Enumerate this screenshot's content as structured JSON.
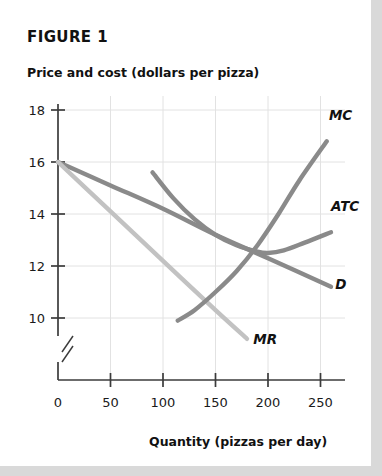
{
  "figure": {
    "title": "FIGURE 1",
    "y_axis_title": "Price and cost (dollars per pizza)",
    "x_axis_title": "Quantity (pizzas per day)"
  },
  "colors": {
    "page_background": "#ffffff",
    "surround": "#d9d9d9",
    "axis": "#3b3b3b",
    "gridline": "#e2e2e2",
    "demand_curve": "#8a8a8a",
    "marginal_revenue_curve": "#c2c2c2",
    "marginal_cost_curve": "#8a8a8a",
    "average_total_cost_curve": "#8a8a8a",
    "text": "#111111"
  },
  "chart_data": {
    "type": "line",
    "title": "FIGURE 1",
    "xlabel": "Quantity (pizzas per day)",
    "ylabel": "Price and cost (dollars per pizza)",
    "xlim": [
      0,
      275
    ],
    "ylim": [
      9,
      18.6
    ],
    "y_axis_break": true,
    "grid": true,
    "legend": "inline-curve-labels",
    "xticks": [
      0,
      50,
      100,
      150,
      200,
      250
    ],
    "xtick_labels": [
      "0",
      "50",
      "100",
      "150",
      "200",
      "250"
    ],
    "yticks": [
      10,
      12,
      14,
      16,
      18
    ],
    "ytick_labels": [
      "10",
      "12",
      "14",
      "16",
      "18"
    ],
    "series": [
      {
        "name": "D",
        "label": "D",
        "description": "Demand curve, downward sloping straight line",
        "color": "#8a8a8a",
        "x": [
          0,
          50,
          100,
          150,
          200,
          260
        ],
        "y": [
          16.0,
          15.1,
          14.2,
          13.2,
          12.3,
          11.2
        ]
      },
      {
        "name": "MR",
        "label": "MR",
        "description": "Marginal revenue curve, downward sloping straight line, twice the slope of D",
        "color": "#c2c2c2",
        "x": [
          0,
          50,
          100,
          150,
          180
        ],
        "y": [
          16.0,
          14.1,
          12.2,
          10.3,
          9.2
        ]
      },
      {
        "name": "MC",
        "label": "MC",
        "description": "Marginal cost curve, upward sloping, rises steeply at high output",
        "color": "#8a8a8a",
        "x": [
          114,
          130,
          150,
          170,
          190,
          210,
          230,
          256
        ],
        "y": [
          9.9,
          10.3,
          11.0,
          11.8,
          12.8,
          14.0,
          15.3,
          16.8
        ]
      },
      {
        "name": "ATC",
        "label": "ATC",
        "description": "Average total cost curve, U-shaped with minimum near quantity 200",
        "color": "#8a8a8a",
        "x": [
          90,
          110,
          130,
          150,
          170,
          190,
          200,
          215,
          235,
          260
        ],
        "y": [
          15.6,
          14.6,
          13.8,
          13.2,
          12.8,
          12.55,
          12.5,
          12.6,
          12.9,
          13.3
        ]
      }
    ],
    "annotations": [
      {
        "text": "MC",
        "x": 258,
        "y": 17.6
      },
      {
        "text": "ATC",
        "x": 260,
        "y": 14.1
      },
      {
        "text": "D",
        "x": 264,
        "y": 11.1
      },
      {
        "text": "MR",
        "x": 186,
        "y": 9.0
      }
    ]
  }
}
